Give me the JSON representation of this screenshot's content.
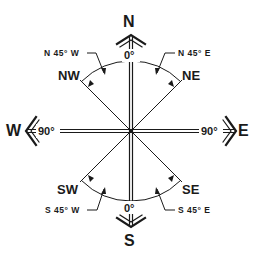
{
  "diagram": {
    "cardinals": {
      "north": "N",
      "south": "S",
      "east": "E",
      "west": "W"
    },
    "intercardinals": {
      "northwest": "NW",
      "northeast": "NE",
      "southwest": "SW",
      "southeast": "SE"
    },
    "angles": {
      "north_zero": "0°",
      "south_zero": "0°",
      "west_ninety": "90°",
      "east_ninety": "90°"
    },
    "bearings": {
      "nw": "N 45° W",
      "ne": "N 45° E",
      "sw": "S 45° W",
      "se": "S 45° E"
    },
    "colors": {
      "ink": "#1a1a1a",
      "background": "#ffffff"
    }
  }
}
